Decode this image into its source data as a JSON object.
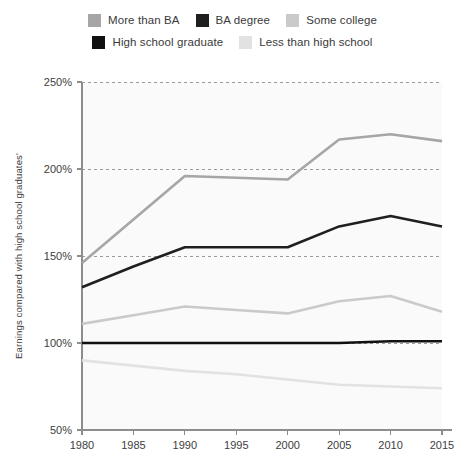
{
  "legend": {
    "rows": [
      [
        {
          "label": "More than BA",
          "color": "#a6a6a6",
          "swatch_name": "legend-swatch-more-than-ba"
        },
        {
          "label": "BA degree",
          "color": "#1f1f1f",
          "swatch_name": "legend-swatch-ba-degree"
        },
        {
          "label": "Some college",
          "color": "#cacaca",
          "swatch_name": "legend-swatch-some-college"
        }
      ],
      [
        {
          "label": "High school graduate",
          "color": "#111111",
          "swatch_name": "legend-swatch-high-school-graduate"
        },
        {
          "label": "Less than high school",
          "color": "#e2e2e2",
          "swatch_name": "legend-swatch-less-than-high-school"
        }
      ]
    ]
  },
  "axes": {
    "y_title": "Earnings compared with high school graduates'",
    "y_ticks": [
      "250%",
      "200%",
      "150%",
      "100%",
      "50%"
    ],
    "x_ticks": [
      "1980",
      "1985",
      "1990",
      "1995",
      "2000",
      "2005",
      "2010",
      "2015"
    ]
  },
  "chart_data": {
    "type": "line",
    "title": "",
    "subtitle": "",
    "xlabel": "",
    "ylabel": "Earnings compared with high school graduates'",
    "x": [
      1980,
      1985,
      1990,
      1995,
      2000,
      2005,
      2010,
      2015
    ],
    "xlim": [
      1980,
      2015
    ],
    "ylim": [
      50,
      250
    ],
    "y_unit": "%",
    "y_tick_values": [
      50,
      100,
      150,
      200,
      250
    ],
    "grid": "horizontal-dashed",
    "legend_position": "top",
    "series": [
      {
        "name": "More than BA",
        "color": "#a6a6a6",
        "width": 2.6,
        "values": [
          146,
          171,
          196,
          195,
          194,
          217,
          220,
          216
        ]
      },
      {
        "name": "BA degree",
        "color": "#1f1f1f",
        "width": 2.6,
        "values": [
          132,
          144,
          155,
          155,
          155,
          167,
          173,
          167
        ]
      },
      {
        "name": "Some college",
        "color": "#cacaca",
        "width": 2.6,
        "values": [
          111,
          116,
          121,
          119,
          117,
          124,
          127,
          118
        ]
      },
      {
        "name": "High school graduate",
        "color": "#111111",
        "width": 2.6,
        "values": [
          100,
          100,
          100,
          100,
          100,
          100,
          101,
          101
        ]
      },
      {
        "name": "Less than high school",
        "color": "#e2e2e2",
        "width": 2.6,
        "values": [
          90,
          87,
          84,
          82,
          79,
          76,
          75,
          74
        ]
      }
    ]
  }
}
